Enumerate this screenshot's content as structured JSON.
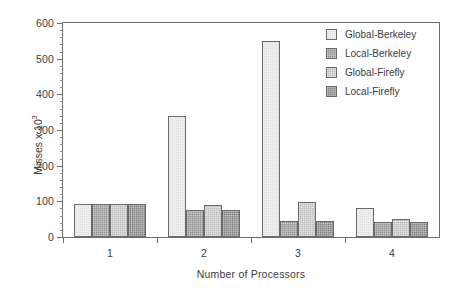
{
  "chart_data": {
    "type": "bar",
    "title": "",
    "xlabel": "Number of Processors",
    "ylabel": "Misses x 10",
    "ylabel_exponent": "3",
    "categories": [
      "1",
      "2",
      "3",
      "4"
    ],
    "xtick_labels": [
      "1",
      "2",
      "3",
      "4"
    ],
    "ytick_labels": [
      "0",
      "100",
      "200",
      "300",
      "400",
      "500",
      "600"
    ],
    "ytick_values": [
      0,
      100,
      200,
      300,
      400,
      500,
      600
    ],
    "ylim": [
      0,
      600
    ],
    "y_minor_step": 20,
    "grid": false,
    "legend_position": "top-right",
    "series": [
      {
        "name": "Global-Berkeley",
        "color": "#e2e2e2",
        "values": [
          93,
          340,
          550,
          82
        ]
      },
      {
        "name": "Local-Berkeley",
        "color": "#8f8f8f",
        "values": [
          93,
          75,
          45,
          42
        ]
      },
      {
        "name": "Global-Firefly",
        "color": "#bfbfbf",
        "values": [
          93,
          90,
          97,
          50
        ]
      },
      {
        "name": "Local-Firefly",
        "color": "#7d7d7d",
        "values": [
          93,
          75,
          45,
          42
        ]
      }
    ]
  },
  "legend": {
    "items": [
      {
        "label": "Global-Berkeley",
        "swatch": "legend-swatch-global-berkeley"
      },
      {
        "label": "Local-Berkeley",
        "swatch": "legend-swatch-local-berkeley"
      },
      {
        "label": "Global-Firefly",
        "swatch": "legend-swatch-global-firefly"
      },
      {
        "label": "Local-Firefly",
        "swatch": "legend-swatch-local-firefly"
      }
    ]
  },
  "axes": {
    "x_title": "Number of Processors",
    "y_title_main": "Misses x 10",
    "y_title_sup": "3"
  }
}
